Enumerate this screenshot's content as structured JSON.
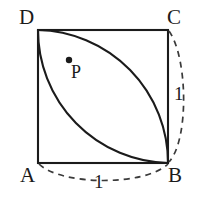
{
  "figure": {
    "shape_type": "geometry-diagram",
    "stroke_color": "#1b1b1b",
    "dash_color": "#3a3a3a",
    "background_color": "#ffffff",
    "square": {
      "name": "square-ABCD",
      "side_length_label": "1",
      "vertices": [
        {
          "id": "A",
          "label": "A",
          "x": 38,
          "y": 163,
          "position": "bottom-left"
        },
        {
          "id": "B",
          "label": "B",
          "x": 168,
          "y": 163,
          "position": "bottom-right"
        },
        {
          "id": "C",
          "label": "C",
          "x": 168,
          "y": 30,
          "position": "top-right"
        },
        {
          "id": "D",
          "label": "D",
          "x": 38,
          "y": 30,
          "position": "top-left"
        }
      ]
    },
    "arcs": [
      {
        "name": "arc-centered-at-A",
        "center": "A",
        "from": "D",
        "to": "B",
        "radius_label": "1",
        "style": "solid",
        "bulge_toward": "C"
      },
      {
        "name": "arc-centered-at-C",
        "center": "C",
        "from": "D",
        "to": "B",
        "radius_label": "1",
        "style": "solid",
        "bulge_toward": "A"
      },
      {
        "name": "dashed-arc-right-side",
        "center": "B",
        "from": "C",
        "to": "B",
        "radius_label": "1",
        "style": "dashed",
        "side": "right"
      },
      {
        "name": "dashed-arc-bottom-side",
        "center": "A",
        "from": "A",
        "to": "B",
        "radius_label": "1",
        "style": "dashed",
        "side": "bottom"
      }
    ],
    "interior_point": {
      "name": "point-P",
      "label": "P",
      "x": 69,
      "y": 60,
      "dot_radius": 3
    },
    "measure_labels": [
      {
        "id": "right",
        "text": "1",
        "x": 174,
        "y": 84
      },
      {
        "id": "bottom",
        "text": "1",
        "x": 94,
        "y": 172
      }
    ]
  }
}
